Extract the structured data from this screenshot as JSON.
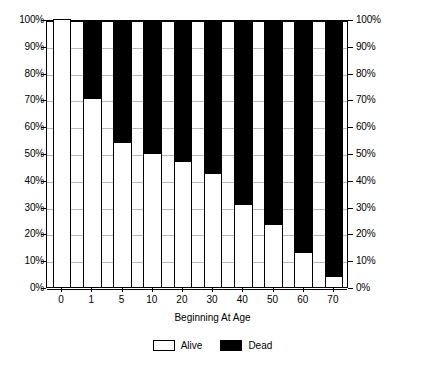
{
  "chart_data": {
    "type": "bar",
    "subtype": "100% stacked bar",
    "title": "",
    "xlabel": "Beginning At Age",
    "ylabel": "",
    "categories": [
      "0",
      "1",
      "5",
      "10",
      "20",
      "30",
      "40",
      "50",
      "60",
      "70"
    ],
    "series": [
      {
        "name": "Alive",
        "color": "#ffffff",
        "values": [
          100,
          70.5,
          54,
          50,
          47,
          42.5,
          31,
          23.5,
          13,
          4
        ]
      },
      {
        "name": "Dead",
        "color": "#000000",
        "values": [
          0,
          29.5,
          46,
          50,
          53,
          57.5,
          69,
          76.5,
          87,
          96
        ]
      }
    ],
    "ylim": [
      0,
      100
    ],
    "ytick_labels": [
      "0%",
      "10%",
      "20%",
      "30%",
      "40%",
      "50%",
      "60%",
      "70%",
      "80%",
      "90%",
      "100%"
    ],
    "ytick_values": [
      0,
      10,
      20,
      30,
      40,
      50,
      60,
      70,
      80,
      90,
      100
    ],
    "y_axis_right_labels": [
      "0%",
      "10%",
      "20%",
      "30%",
      "40%",
      "50%",
      "60%",
      "70%",
      "80%",
      "90%",
      "100%"
    ],
    "grid": true,
    "grid_axis": "y",
    "legend_position": "bottom",
    "legend": [
      "Alive",
      "Dead"
    ]
  },
  "axis": {
    "x_title": "Beginning At Age"
  },
  "legend": {
    "items": [
      {
        "label": "Alive",
        "swatch": "white-square-icon"
      },
      {
        "label": "Dead",
        "swatch": "black-square-icon"
      }
    ]
  },
  "colors": {
    "alive": "#ffffff",
    "dead": "#000000",
    "grid": "#b9b9b9",
    "axis": "#000000",
    "background": "#ffffff"
  }
}
